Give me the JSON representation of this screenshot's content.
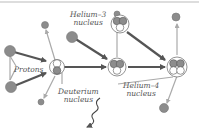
{
  "diagram": {
    "labels": {
      "protons": "Protons",
      "deuterium_line1": "Deuterium",
      "deuterium_line2": "nucleus",
      "helium3_line1": "Helium–3",
      "helium3_line2": "nucleus",
      "helium4_line1": "Helium–4",
      "helium4_line2": "nucleus"
    },
    "colors": {
      "proton": "#8c8c8c",
      "neutron": "#ffffff",
      "arrow_dark": "#5a5a5a",
      "arrow_light": "#aaaaaa",
      "text": "#555555",
      "border": "#bbbbbb"
    },
    "nodes": [
      {
        "id": "proton-1",
        "type": "proton"
      },
      {
        "id": "proton-2",
        "type": "proton"
      },
      {
        "id": "deuterium",
        "type": "deuterium"
      },
      {
        "id": "proton-3",
        "type": "proton"
      },
      {
        "id": "helium-3-input",
        "type": "helium-3"
      },
      {
        "id": "helium-3",
        "type": "helium-3"
      },
      {
        "id": "helium-4",
        "type": "helium-4"
      },
      {
        "id": "positron",
        "type": "particle"
      },
      {
        "id": "gamma-ray",
        "type": "photon"
      }
    ]
  }
}
